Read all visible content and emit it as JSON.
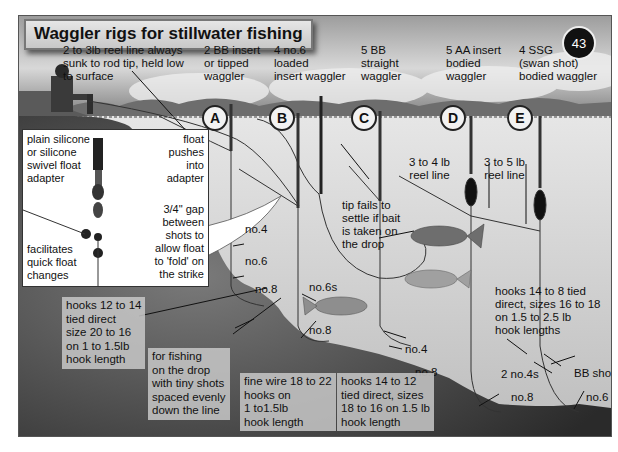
{
  "title": "Waggler rigs for stillwater fishing",
  "page_number": "43",
  "top_notes": {
    "reel_line_note": [
      "2 to 3lb reel line always",
      "sunk to rod tip, held low",
      "to surface"
    ]
  },
  "rigs": [
    {
      "letter": "A",
      "description": [
        "2 BB insert",
        "or tipped",
        "waggler"
      ]
    },
    {
      "letter": "B",
      "description": [
        "4 no.6",
        "loaded",
        "insert waggler"
      ]
    },
    {
      "letter": "C",
      "description": [
        "5 BB",
        "straight",
        "waggler"
      ]
    },
    {
      "letter": "D",
      "description": [
        "5 AA insert",
        "bodied",
        "waggler"
      ]
    },
    {
      "letter": "E",
      "description": [
        "4 SSG",
        "(swan shot)",
        "bodied waggler"
      ]
    }
  ],
  "inset": {
    "adapter_label": [
      "plain silicone",
      "or silicone",
      "swivel float",
      "adapter"
    ],
    "float_label": [
      "float",
      "pushes",
      "into",
      "adapter"
    ],
    "gap_label": [
      "3/4\" gap",
      "between",
      "shots to",
      "allow float",
      "to 'fold' on",
      "the strike"
    ],
    "changes_label": [
      "facilitates",
      "quick float",
      "changes"
    ]
  },
  "shot_labels": {
    "a_no4": "no.4",
    "a_no6": "no.6",
    "a_no8": "no.8",
    "b_no6s": "no.6s",
    "b_no8": "no.8",
    "c_no4": "no.4",
    "c_no8": "no.8",
    "d_no4s": "2  no.4s",
    "d_no8": "no.8",
    "e_bb": "BB shot",
    "e_no6": "no.6"
  },
  "line_notes": {
    "d_reel": [
      "3 to 4 lb",
      "reel line"
    ],
    "e_reel": [
      "3 to 5 lb",
      "reel line"
    ],
    "tip_fails": [
      "tip fails to",
      "settle if bait",
      "is taken on",
      "the drop"
    ]
  },
  "hook_notes": {
    "a_hooks": [
      "hooks 12 to 14",
      "tied direct",
      "size 20 to 16",
      "on 1 to 1.5lb",
      "hook length"
    ],
    "drop_fishing": [
      "for fishing",
      "on the drop",
      "with tiny shots",
      "spaced evenly",
      "down the line"
    ],
    "b_hooks": [
      "fine wire 18 to 22",
      "hooks on",
      "1 to1.5lb",
      "hook length"
    ],
    "c_hooks": [
      "hooks 14 to 12",
      "tied direct, sizes",
      "18 to 16 on 1.5 lb",
      "hook length"
    ],
    "de_hooks": [
      "hooks 14 to 8 tied",
      "direct, sizes 16 to 18",
      "on 1.5 to 2.5 lb",
      "hook lengths"
    ]
  }
}
